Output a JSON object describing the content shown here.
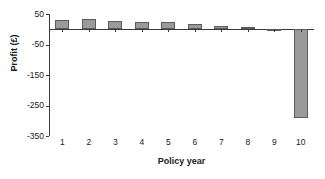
{
  "chart_data": {
    "type": "bar",
    "title": "",
    "subtitle": "",
    "xlabel": "Policy year",
    "ylabel": "Profit (£)",
    "categories": [
      "1",
      "2",
      "3",
      "4",
      "5",
      "6",
      "7",
      "8",
      "9",
      "10"
    ],
    "values": [
      30,
      35,
      28,
      24,
      23,
      17,
      10,
      6,
      1,
      -290
    ],
    "series": [
      {
        "name": "Profit",
        "values": [
          30,
          35,
          28,
          24,
          23,
          17,
          10,
          6,
          1,
          -290
        ]
      }
    ],
    "ylim": [
      -350,
      50
    ],
    "xlim": [
      0.4,
      10.6
    ],
    "yticks": [
      50,
      -50,
      -150,
      -250,
      -350
    ],
    "ytick_labels": [
      "50",
      "-50",
      "-150",
      "-250",
      "-350"
    ],
    "xtick_labels": [
      "1",
      "2",
      "3",
      "4",
      "5",
      "6",
      "7",
      "8",
      "9",
      "10"
    ],
    "grid": false,
    "legend": false,
    "legend_position": "none",
    "bar_fill_color": "#9a9a9a",
    "bar_border_color": "#5c5c5c",
    "axis_color": "#3a3a3a",
    "background_color": "#ffffff",
    "text_color": "#1a1a1a"
  }
}
